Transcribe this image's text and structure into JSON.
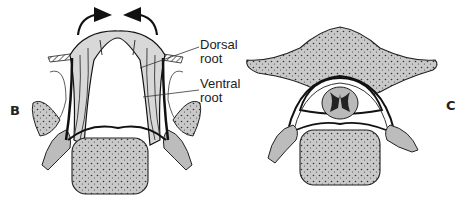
{
  "figure": {
    "panels": [
      {
        "id": "B",
        "label": "B",
        "description": "Spinal cord flexed with dorsal and ventral roots, arrows indicating bending"
      },
      {
        "id": "C",
        "label": "C",
        "description": "Cross-section of vertebra with spinal cord in canal"
      }
    ],
    "annotations": {
      "dorsal": "Dorsal",
      "dorsal2": "root",
      "ventral": "Ventral",
      "ventral2": "root"
    },
    "colors": {
      "bone_fill": "#c9c9c9",
      "outline": "#1a1a1a",
      "background": "#ffffff"
    }
  }
}
